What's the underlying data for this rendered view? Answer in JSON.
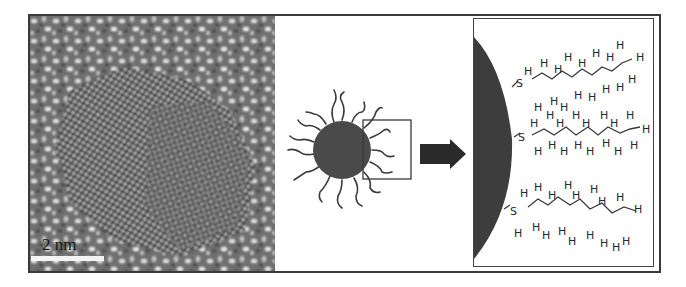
{
  "figure": {
    "panels": [
      {
        "id": "tem-image",
        "description": "HRTEM lattice image of nanocrystal"
      },
      {
        "id": "schematic",
        "description": "Nanoparticle with ligand shell, zoom box"
      },
      {
        "id": "zoom-detail",
        "description": "Surface-bound alkanethiol chains"
      }
    ],
    "scale_bar": {
      "label": "2 nm"
    },
    "arrow": {
      "direction": "right",
      "color": "#2a2a2a"
    },
    "ligand": {
      "anchor_atom": "S",
      "hydrogen_label": "H",
      "chain_count": 3
    },
    "colors": {
      "particle": "#4a4a4a",
      "surface": "#3d3d3d",
      "frame": "#3a3a3a",
      "scale_bar": "#f4f4f4"
    }
  }
}
